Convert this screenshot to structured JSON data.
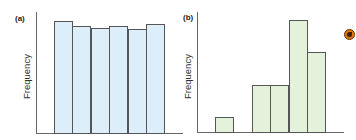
{
  "chart_data": [
    {
      "type": "bar",
      "title": "(a)",
      "xlabel": "",
      "ylabel": "Frequency",
      "categories": [
        "1",
        "2",
        "3",
        "4",
        "5",
        "6"
      ],
      "values": [
        112,
        107,
        105,
        107,
        104,
        109
      ],
      "ylim": [
        0,
        115
      ],
      "grid": false,
      "bar_color": "#dbeefa",
      "edge_color": "#555555"
    },
    {
      "type": "bar",
      "title": "(b)",
      "xlabel": "",
      "ylabel": "Frequency",
      "categories": [
        "1",
        "2",
        "3",
        "4",
        "5",
        "6"
      ],
      "values": [
        15,
        0,
        47,
        47,
        112,
        80
      ],
      "ylim": [
        0,
        115
      ],
      "grid": false,
      "bar_color": "#e4f2dc",
      "edge_color": "#555555"
    }
  ],
  "panels": {
    "a": {
      "label": "(a)",
      "ylabel": "Frequency"
    },
    "b": {
      "label": "(b)",
      "ylabel": "Frequency"
    }
  },
  "icons": {
    "marker": "globe-icon"
  }
}
